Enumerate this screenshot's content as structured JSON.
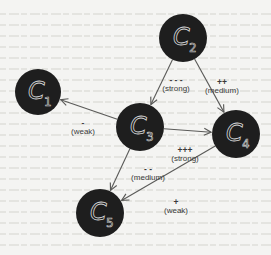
{
  "diagram": {
    "title": "",
    "colors": {
      "background": "#f4f4f2",
      "node_fill": "#1e1e1e",
      "node_text": "#d8d8d8",
      "edge": "#5a5a58",
      "label": "#3a3a3a"
    },
    "nodes": [
      {
        "id": "C1",
        "letter": "C",
        "sub": "1",
        "x": 38,
        "y": 92,
        "r": 23
      },
      {
        "id": "C2",
        "letter": "C",
        "sub": "2",
        "x": 183,
        "y": 38,
        "r": 24
      },
      {
        "id": "C3",
        "letter": "C",
        "sub": "3",
        "x": 140,
        "y": 127,
        "r": 24
      },
      {
        "id": "C4",
        "letter": "C",
        "sub": "4",
        "x": 236,
        "y": 134,
        "r": 24
      },
      {
        "id": "C5",
        "letter": "C",
        "sub": "5",
        "x": 100,
        "y": 213,
        "r": 24
      }
    ],
    "edges": [
      {
        "from": "C2",
        "to": "C3",
        "sign": "- - -",
        "strength": "(strong)",
        "lx": 176,
        "ly": 83
      },
      {
        "from": "C2",
        "to": "C4",
        "sign": "++",
        "strength": "(medium)",
        "lx": 222,
        "ly": 85
      },
      {
        "from": "C3",
        "to": "C1",
        "sign": "-",
        "strength": "(weak)",
        "lx": 83,
        "ly": 126
      },
      {
        "from": "C3",
        "to": "C4",
        "sign": "+++",
        "strength": "(strong)",
        "lx": 185,
        "ly": 153
      },
      {
        "from": "C3",
        "to": "C5",
        "sign": "- -",
        "strength": "(medium)",
        "lx": 148,
        "ly": 172
      },
      {
        "from": "C4",
        "to": "C5",
        "sign": "+",
        "strength": "(weak)",
        "lx": 176,
        "ly": 205
      }
    ]
  }
}
